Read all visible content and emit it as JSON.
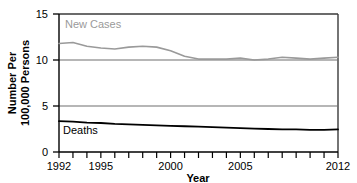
{
  "chart_data": {
    "type": "line",
    "title": "",
    "xlabel": "Year",
    "ylabel": "Number Per\n100,000 Persons",
    "ylabel_line1": "Number Per",
    "ylabel_line2": "100,000 Persons",
    "xlim": [
      1992,
      2012
    ],
    "ylim": [
      0,
      15
    ],
    "yticks": [
      0,
      5,
      10,
      15
    ],
    "ytick_labels": [
      "0",
      "5",
      "10",
      "15"
    ],
    "xticks": [
      1992,
      1993,
      1994,
      1995,
      1996,
      1997,
      1998,
      1999,
      2000,
      2001,
      2002,
      2003,
      2004,
      2005,
      2006,
      2007,
      2008,
      2009,
      2010,
      2011,
      2012
    ],
    "xtick_labels_shown": [
      "1992",
      "1995",
      "2000",
      "2005",
      "2012"
    ],
    "grid": "horizontal-at-5-and-10",
    "legend": "inline-labels",
    "x": [
      1992,
      1993,
      1994,
      1995,
      1996,
      1997,
      1998,
      1999,
      2000,
      2001,
      2002,
      2003,
      2004,
      2005,
      2006,
      2007,
      2008,
      2009,
      2010,
      2011,
      2012
    ],
    "series": [
      {
        "name": "New Cases",
        "color": "#9a9a9a",
        "label_text": "New Cases",
        "values": [
          11.8,
          11.9,
          11.5,
          11.3,
          11.2,
          11.4,
          11.5,
          11.4,
          11.0,
          10.4,
          10.1,
          10.1,
          10.1,
          10.2,
          10.0,
          10.1,
          10.3,
          10.2,
          10.1,
          10.2,
          10.3
        ]
      },
      {
        "name": "Deaths",
        "color": "#000000",
        "label_text": "Deaths",
        "values": [
          3.35,
          3.3,
          3.2,
          3.15,
          3.05,
          3.0,
          2.95,
          2.9,
          2.85,
          2.8,
          2.75,
          2.7,
          2.65,
          2.6,
          2.55,
          2.5,
          2.45,
          2.45,
          2.4,
          2.4,
          2.45
        ]
      }
    ]
  },
  "axes": {
    "y_tick_0": "0",
    "y_tick_5": "5",
    "y_tick_10": "10",
    "y_tick_15": "15",
    "x_tick_1992": "1992",
    "x_tick_1995": "1995",
    "x_tick_2000": "2000",
    "x_tick_2005": "2005",
    "x_tick_2012": "2012",
    "x_axis_title": "Year",
    "y_axis_title_line1": "Number Per",
    "y_axis_title_line2": "100,000 Persons"
  },
  "annotations": {
    "new_cases_label": "New Cases",
    "deaths_label": "Deaths"
  },
  "colors": {
    "new_cases": "#9a9a9a",
    "deaths": "#000000",
    "axis": "#000000",
    "grid": "#7d7d7d",
    "background": "#ffffff"
  }
}
